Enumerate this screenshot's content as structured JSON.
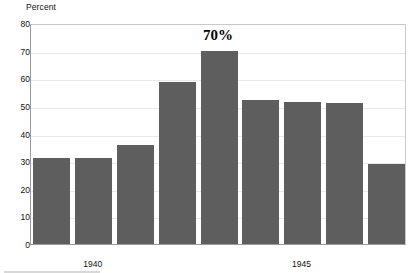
{
  "chart_data": {
    "type": "bar",
    "title": "",
    "subtitle": "",
    "xlabel": "",
    "ylabel": "Percent",
    "ylim": [
      0,
      80
    ],
    "ytick_values": [
      0,
      10,
      20,
      30,
      40,
      50,
      60,
      70,
      80
    ],
    "ytick_labels": [
      "0",
      "10",
      "20",
      "30",
      "40",
      "50",
      "60",
      "70",
      "80"
    ],
    "grid": true,
    "grid_axis": "y",
    "legend": "none",
    "bar_color": "#5e5e5e",
    "categories": [
      "1939",
      "1940",
      "1941",
      "1942",
      "1943",
      "1944",
      "1945",
      "1946",
      "1947"
    ],
    "values": [
      31,
      31,
      36,
      58.5,
      70,
      52,
      51.5,
      51,
      29
    ],
    "xtick_labels": [
      "1940",
      "1945"
    ],
    "xtick_positions": [
      1,
      6
    ],
    "annotations": [
      {
        "text": "70%",
        "category_index": 4,
        "value": 70
      }
    ]
  },
  "axes": {
    "y_title": "Percent",
    "y_ticks": [
      {
        "label": "80",
        "value": 80
      },
      {
        "label": "70",
        "value": 70
      },
      {
        "label": "60",
        "value": 60
      },
      {
        "label": "50",
        "value": 50
      },
      {
        "label": "40",
        "value": 40
      },
      {
        "label": "30",
        "value": 30
      },
      {
        "label": "20",
        "value": 20
      },
      {
        "label": "10",
        "value": 10
      },
      {
        "label": "0",
        "value": 0
      }
    ],
    "x_ticks": [
      {
        "label": "1940",
        "bar_index": 1
      },
      {
        "label": "1945",
        "bar_index": 6
      }
    ]
  },
  "annotation": {
    "label": "70%"
  },
  "colors": {
    "bar_fill": "#5e5e5e",
    "gridline": "#e9e9e9",
    "axis_line": "#9a9a9a",
    "frame_line": "#c9c9c9",
    "text": "#111111",
    "background": "#ffffff"
  }
}
